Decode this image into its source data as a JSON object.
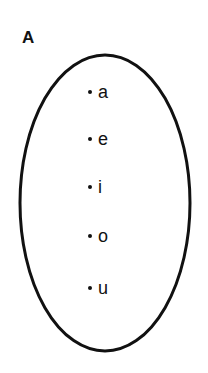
{
  "diagram": {
    "type": "set-diagram",
    "set": {
      "label": "A",
      "elements": [
        {
          "label": "a"
        },
        {
          "label": "e"
        },
        {
          "label": "i"
        },
        {
          "label": "o"
        },
        {
          "label": "u"
        }
      ]
    },
    "colors": {
      "stroke": "#111111",
      "background": "#ffffff"
    }
  }
}
